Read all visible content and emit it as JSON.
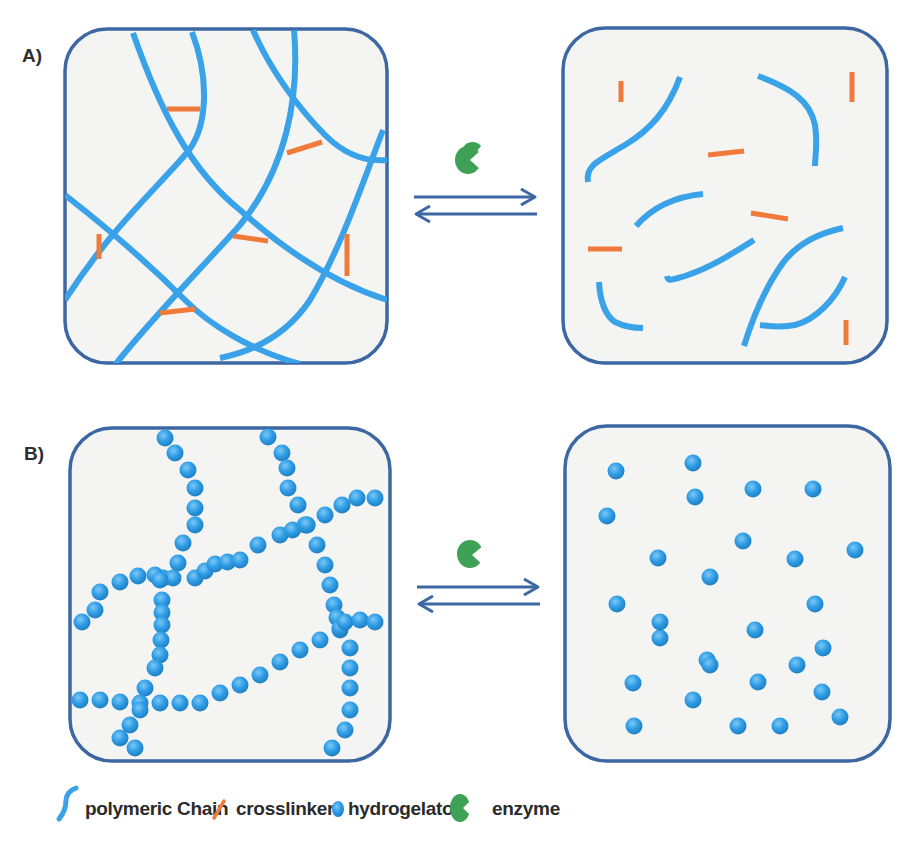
{
  "figure": {
    "panels": [
      {
        "label": "A)",
        "left_state": "crosslinked polymer network (gel)",
        "right_state": "cleaved polymer fragments and free crosslinkers (sol)"
      },
      {
        "label": "B)",
        "left_state": "self-assembled hydrogelator fibers (gel)",
        "right_state": "dispersed hydrogelator molecules (sol)"
      }
    ],
    "transition": "reversible enzyme-mediated gel-sol transition",
    "legend": [
      {
        "icon": "polymeric-chain-icon",
        "label": "polymeric Chain"
      },
      {
        "icon": "crosslinker-icon",
        "label": "crosslinker"
      },
      {
        "icon": "hydrogelator-icon",
        "label": "hydrogelator"
      },
      {
        "icon": "enzyme-icon",
        "label": "enzyme"
      }
    ]
  },
  "colors": {
    "frame": "#3c67a3",
    "panel_fill": "#f4f5f3",
    "polymer_chain": "#3aa2e8",
    "crosslinker": "#f07a3a",
    "hydrogelator": "#2f9de6",
    "enzyme": "#3ea155",
    "arrow": "#3c67a3"
  }
}
